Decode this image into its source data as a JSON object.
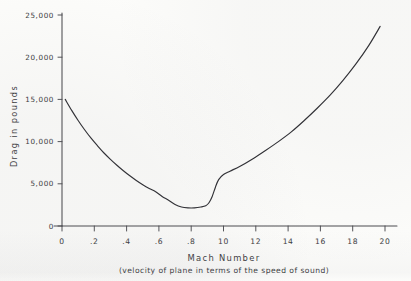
{
  "figure": {
    "background_color": "#fcfcfa",
    "ink_color": "#2e2e33",
    "axis_color": "#4a4a4e"
  },
  "chart_data": {
    "type": "line",
    "title": "",
    "xlabel": "Mach  Number",
    "xlabel_sub": "(velocity of plane in terms of the speed of sound)",
    "ylabel": "Drag  in  pounds",
    "xlim": [
      0,
      2.0
    ],
    "ylim": [
      0,
      25000
    ],
    "grid": false,
    "legend": null,
    "x_tick_labels": [
      "0",
      ".2",
      ".4",
      ".6",
      ".8",
      "10",
      "12",
      "14",
      "16",
      "18",
      "20"
    ],
    "x_tick_values": [
      0,
      0.2,
      0.4,
      0.6,
      0.8,
      1.0,
      1.2,
      1.4,
      1.6,
      1.8,
      2.0
    ],
    "y_tick_labels": [
      "0",
      "5,000",
      "10,000",
      "15,000",
      "20,000",
      "25,000"
    ],
    "y_tick_values": [
      0,
      5000,
      10000,
      15000,
      20000,
      25000
    ],
    "series": [
      {
        "name": "drag",
        "x": [
          0.02,
          0.06,
          0.1,
          0.14,
          0.18,
          0.22,
          0.26,
          0.3,
          0.34,
          0.38,
          0.42,
          0.46,
          0.5,
          0.54,
          0.58,
          0.62,
          0.66,
          0.7,
          0.74,
          0.78,
          0.82,
          0.86,
          0.89,
          0.91,
          0.93,
          0.95,
          0.97,
          1.0,
          1.04,
          1.1,
          1.18,
          1.26,
          1.34,
          1.42,
          1.5,
          1.58,
          1.66,
          1.74,
          1.82,
          1.9,
          1.97
        ],
        "y": [
          15000,
          13700,
          12500,
          11400,
          10400,
          9500,
          8650,
          7900,
          7200,
          6550,
          5950,
          5400,
          4900,
          4450,
          4050,
          3500,
          3050,
          2550,
          2250,
          2150,
          2150,
          2250,
          2400,
          2750,
          3500,
          4600,
          5500,
          6100,
          6500,
          7050,
          7950,
          8950,
          10000,
          11150,
          12500,
          13950,
          15500,
          17250,
          19200,
          21400,
          23650
        ]
      }
    ]
  }
}
